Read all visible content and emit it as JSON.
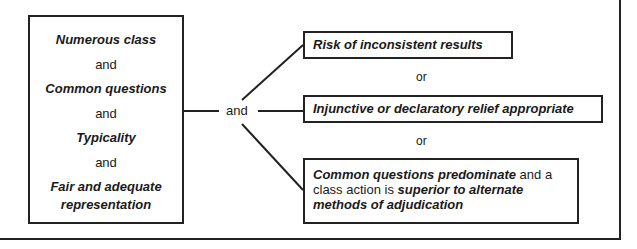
{
  "diagram": {
    "requirements": [
      {
        "label": "Numerous class",
        "style": "bold-italic"
      },
      {
        "label": "and",
        "style": "plain"
      },
      {
        "label": "Common questions",
        "style": "bold-italic"
      },
      {
        "label": "and",
        "style": "plain"
      },
      {
        "label": "Typicality",
        "style": "bold-italic"
      },
      {
        "label": "and",
        "style": "plain"
      },
      {
        "label": "Fair and adequate",
        "style": "bold-italic"
      },
      {
        "label": "representation",
        "style": "bold-italic"
      }
    ],
    "connector_label": "and",
    "alternatives": {
      "option1": "Risk of inconsistent results",
      "or1": "or",
      "option2": "Injunctive or declaratory relief appropriate",
      "or2": "or",
      "option3": {
        "part1_bold": "Common questions predominate",
        "part2": " and a",
        "part3": "class action is ",
        "part4_bold": "superior to alternate",
        "part5_bold": "methods of adjudication"
      }
    },
    "colors": {
      "line": "#222222",
      "text": "#1a1a1a",
      "background": "#ffffff"
    }
  }
}
